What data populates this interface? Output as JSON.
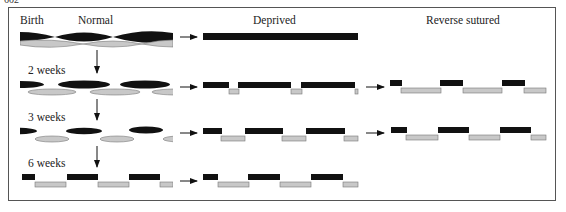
{
  "page_number": "602",
  "headers": {
    "birth": "Birth",
    "normal": "Normal",
    "deprived": "Deprived",
    "reverse": "Reverse sutured"
  },
  "row_labels": [
    "2 weeks",
    "3 weeks",
    "6 weeks"
  ],
  "colors": {
    "left_eye": "#111111",
    "right_eye": "#c8c8c8",
    "right_eye_border": "#777777",
    "arrow": "#111111"
  },
  "legend_semantics": {
    "black": "left-eye (ocular dominance column, open eye)",
    "grey": "right-eye (ocular dominance column)"
  }
}
